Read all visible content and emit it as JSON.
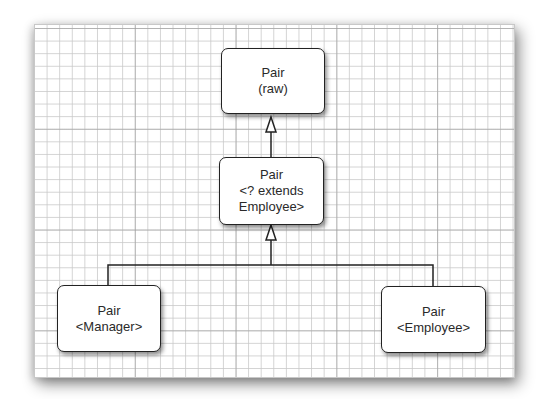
{
  "diagram": {
    "type": "class-hierarchy",
    "nodes": [
      {
        "id": "raw",
        "lines": [
          "Pair",
          "(raw)"
        ]
      },
      {
        "id": "wildcard",
        "lines": [
          "Pair",
          "<? extends",
          "Employee>"
        ]
      },
      {
        "id": "manager",
        "lines": [
          "Pair",
          "<Manager>"
        ]
      },
      {
        "id": "employee",
        "lines": [
          "Pair",
          "<Employee>"
        ]
      }
    ],
    "edges": [
      {
        "from": "wildcard",
        "to": "raw",
        "arrow": "hollow-triangle"
      },
      {
        "from": "manager",
        "to": "wildcard",
        "arrow": "hollow-triangle"
      },
      {
        "from": "employee",
        "to": "wildcard",
        "arrow": "hollow-triangle"
      }
    ],
    "colors": {
      "line": "#222222",
      "box_fill": "#ffffff",
      "grid_minor": "#c8c8c8",
      "grid_major": "#969696"
    }
  }
}
